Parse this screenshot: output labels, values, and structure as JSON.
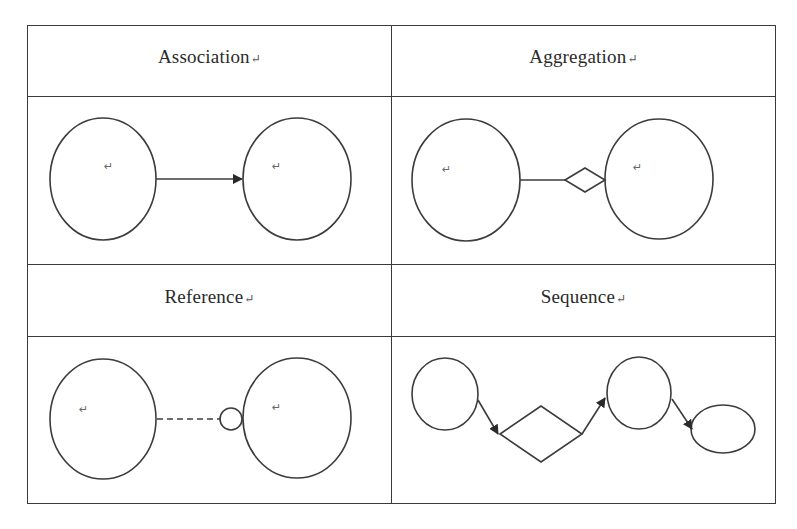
{
  "table": {
    "cells": [
      {
        "title": "Association",
        "mark": "↵",
        "diagram": "association"
      },
      {
        "title": "Aggregation",
        "mark": "↵",
        "diagram": "aggregation"
      },
      {
        "title": "Reference",
        "mark": "↵",
        "diagram": "reference"
      },
      {
        "title": "Sequence",
        "mark": "↵",
        "diagram": "sequence"
      }
    ]
  },
  "diagrams": {
    "association": {
      "description": "Two circles connected by a solid line with a filled arrowhead pointing to the right circle",
      "left_mark": "↵",
      "right_mark": "↵"
    },
    "aggregation": {
      "description": "Two circles connected by a solid line ending in a hollow diamond at the right circle",
      "left_mark": "↵",
      "right_mark": "↵"
    },
    "reference": {
      "description": "Two circles connected by a dashed line ending in a small hollow circle at the right circle",
      "left_mark": "↵",
      "right_mark": "↵"
    },
    "sequence": {
      "description": "Circle → diamond → circle → ellipse chained by arrows"
    }
  },
  "colors": {
    "stroke": "#3c3c3c",
    "border": "#3a3a3a",
    "background": "#ffffff"
  }
}
